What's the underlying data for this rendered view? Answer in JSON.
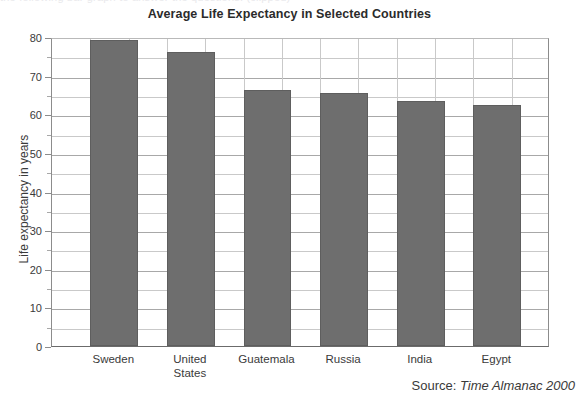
{
  "top_bleed_text": "the following bar graph to answer the questions. (clipped)",
  "source": {
    "prefix": "Source:",
    "reference": "Time Almanac 2000"
  },
  "chart_data": {
    "type": "bar",
    "title": "Average Life Expectancy in Selected Countries",
    "xlabel": "",
    "ylabel": "Life expectancy in years",
    "categories": [
      "Sweden",
      "United\nStates",
      "Guatemala",
      "Russia",
      "India",
      "Egypt"
    ],
    "values": [
      79.3,
      76.1,
      66.4,
      65.5,
      63.5,
      62.4
    ],
    "ylim": [
      0,
      80
    ],
    "ytick_labels": [
      "0",
      "10",
      "20",
      "30",
      "40",
      "50",
      "60",
      "70",
      "80"
    ],
    "ytick_values": [
      0,
      10,
      20,
      30,
      40,
      50,
      60,
      70,
      80
    ],
    "yminor_step": 5,
    "grid": true,
    "legend": "none",
    "bar_color": "#6e6e6e",
    "grid_color": "#c9c9c9",
    "axis_color": "#8c8c8c",
    "vertical_gridline_count": 13
  }
}
